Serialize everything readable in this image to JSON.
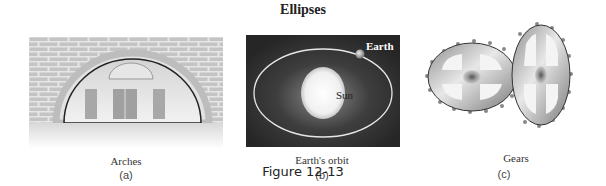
{
  "title": "Ellipses",
  "panels": [
    {
      "caption": "Arches",
      "label": "(a)"
    },
    {
      "caption": "Earth's orbit",
      "label": "(b)",
      "sun_label": "Sun",
      "earth_label": "Earth"
    },
    {
      "caption": "Gears",
      "label": "(c)"
    }
  ],
  "figure_label": "Figure 12-13",
  "colors": {
    "brick": "#c9c9c9",
    "orbit_bg": "#3a3a3a",
    "orbit_line": "#e0e0e0",
    "gear": "#b8b8b8"
  }
}
